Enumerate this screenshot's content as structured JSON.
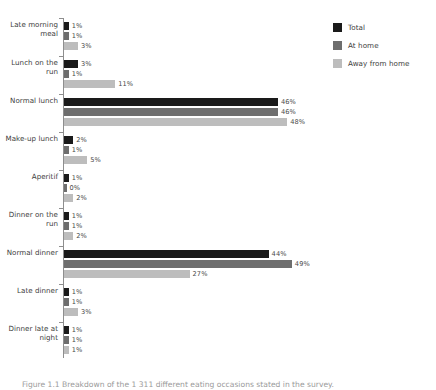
{
  "chart_data": {
    "type": "bar",
    "orientation": "horizontal",
    "title": "",
    "xlabel": "",
    "ylabel": "",
    "xlim": [
      0,
      50
    ],
    "grid": false,
    "legend_position": "top-right",
    "value_suffix": "%",
    "categories": [
      "Late morning meal",
      "Lunch on the run",
      "Normal lunch",
      "Make-up lunch",
      "Aperitif",
      "Dinner on the run",
      "Normal dinner",
      "Late dinner",
      "Dinner late at night"
    ],
    "series": [
      {
        "name": "Total",
        "color": "#1a1a1a",
        "values": [
          1,
          3,
          46,
          2,
          1,
          1,
          44,
          1,
          1
        ],
        "labels": [
          "1%",
          "3%",
          "46%",
          "2%",
          "1%",
          "1%",
          "44%",
          "1%",
          "1%"
        ]
      },
      {
        "name": "At home",
        "color": "#6e6e6e",
        "values": [
          1,
          1,
          46,
          1,
          0,
          1,
          49,
          1,
          1
        ],
        "labels": [
          "1%",
          "1%",
          "46%",
          "1%",
          "0%",
          "1%",
          "49%",
          "1%",
          "1%"
        ]
      },
      {
        "name": "Away from home",
        "color": "#bdbdbd",
        "values": [
          3,
          11,
          48,
          5,
          2,
          2,
          27,
          3,
          1
        ],
        "labels": [
          "3%",
          "11%",
          "48%",
          "5%",
          "2%",
          "2%",
          "27%",
          "3%",
          "1%"
        ]
      }
    ]
  },
  "legend": {
    "items": [
      {
        "label": "Total",
        "swatch": "s0"
      },
      {
        "label": "At home",
        "swatch": "s1"
      },
      {
        "label": "Away from home",
        "swatch": "s2"
      }
    ]
  },
  "caption": {
    "text": "Figure 1.1  Breakdown of the 1 311 different eating occasions stated in the survey."
  }
}
